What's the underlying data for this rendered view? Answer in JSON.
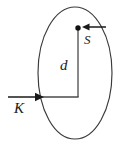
{
  "figure": {
    "name": "flux-through-ellipse-diagram",
    "background_color": "#ffffff",
    "stroke_color": "#3a3a3a",
    "label_color": "#1a1a1a",
    "labels": {
      "distance": "d",
      "vector_s": "S",
      "vector_k": "K"
    },
    "icons": {
      "ellipse": "ellipse-outline-icon",
      "point": "point-dot-icon",
      "arrow_left": "arrow-left-icon",
      "arrow_right": "arrow-right-icon",
      "vertical_segment": "vertical-line-icon",
      "horizontal_segment": "horizontal-line-icon"
    },
    "geometry": {
      "ellipse": {
        "cx": 75,
        "cy": 73,
        "rx": 37,
        "ry": 66
      },
      "point": {
        "x": 78,
        "y": 28,
        "r": 2.6
      },
      "vertical_line": {
        "x": 78,
        "y1": 28,
        "y2": 97
      },
      "horizontal_line": {
        "y": 97,
        "x1": 40,
        "x2": 78
      },
      "arrow_s": {
        "x_from": 106,
        "x_to": 82,
        "y": 27
      },
      "arrow_k": {
        "x_from": 8,
        "x_to": 44,
        "y": 97
      }
    }
  }
}
